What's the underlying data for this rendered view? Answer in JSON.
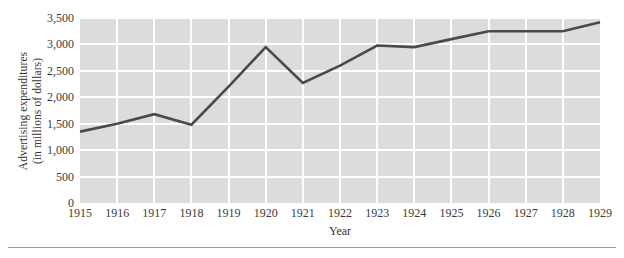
{
  "axis": {
    "ylabel_line1": "Advertising expenditures",
    "ylabel_line2": "(in millions of dollars)",
    "xlabel": "Year"
  },
  "chart_data": {
    "type": "line",
    "title": "",
    "xlabel": "Year",
    "ylabel": "Advertising expenditures (in millions of dollars)",
    "categories": [
      "1915",
      "1916",
      "1917",
      "1918",
      "1919",
      "1920",
      "1921",
      "1922",
      "1923",
      "1924",
      "1925",
      "1926",
      "1927",
      "1928",
      "1929"
    ],
    "values": [
      1350,
      1500,
      1680,
      1480,
      2200,
      2950,
      2270,
      2600,
      2980,
      2950,
      3100,
      3250,
      3250,
      3250,
      3420
    ],
    "series": [
      {
        "name": "Advertising expenditures",
        "color": "#4a4a4a",
        "values": [
          1350,
          1500,
          1680,
          1480,
          2200,
          2950,
          2270,
          2600,
          2980,
          2950,
          3100,
          3250,
          3250,
          3250,
          3420
        ]
      }
    ],
    "ylim": [
      0,
      3500
    ],
    "yticks": [
      0,
      500,
      1000,
      1500,
      2000,
      2500,
      3000,
      3500
    ],
    "ytick_labels": [
      "0",
      "500",
      "1,000",
      "1,500",
      "2,000",
      "2,500",
      "3,000",
      "3,500"
    ],
    "xtick_labels": [
      "1915",
      "1916",
      "1917",
      "1918",
      "1919",
      "1920",
      "1921",
      "1922",
      "1923",
      "1924",
      "1925",
      "1926",
      "1927",
      "1928",
      "1929"
    ],
    "grid": true,
    "grid_color": "#ffffff",
    "plot_background": "#dcdcdc",
    "legend": null,
    "legend_position": "none"
  }
}
